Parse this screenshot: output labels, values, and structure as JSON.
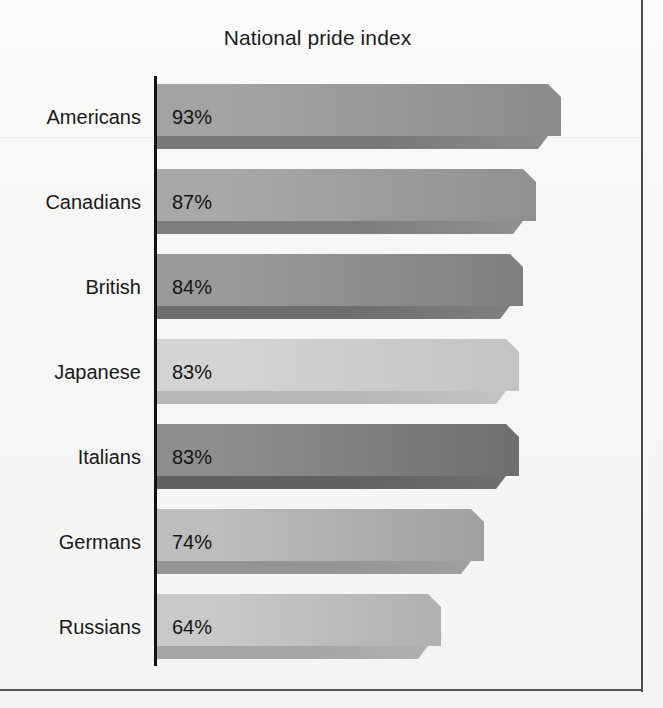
{
  "chart_data": {
    "type": "bar",
    "orientation": "horizontal",
    "title": "National pride index",
    "xlabel": "",
    "ylabel": "",
    "grid": false,
    "legend": false,
    "value_suffix": "%",
    "categories": [
      "Americans",
      "Canadians",
      "British",
      "Japanese",
      "Italians",
      "Germans",
      "Russians"
    ],
    "values": [
      93,
      87,
      84,
      83,
      83,
      74,
      64
    ],
    "value_labels": [
      "93%",
      "87%",
      "84%",
      "83%",
      "83%",
      "74%",
      "64%"
    ],
    "xlim": [
      0,
      100
    ],
    "bars": [
      {
        "category": "Americans",
        "value": 93,
        "label": "93%",
        "px_length": 404,
        "fill_light": "#a3a3a3",
        "fill_dark": "#8b8b8b",
        "edge": "#787878"
      },
      {
        "category": "Canadians",
        "value": 87,
        "label": "87%",
        "px_length": 379,
        "fill_light": "#a8a8a8",
        "fill_dark": "#909090",
        "edge": "#7d7d7d"
      },
      {
        "category": "British",
        "value": 84,
        "label": "84%",
        "px_length": 366,
        "fill_light": "#9a9a9a",
        "fill_dark": "#7f7f7f",
        "edge": "#6e6e6e"
      },
      {
        "category": "Japanese",
        "value": 83,
        "label": "83%",
        "px_length": 362,
        "fill_light": "#d4d4d4",
        "fill_dark": "#c3c3c3",
        "edge": "#b6b6b6"
      },
      {
        "category": "Italians",
        "value": 83,
        "label": "83%",
        "px_length": 362,
        "fill_light": "#8e8e8e",
        "fill_dark": "#6f6f6f",
        "edge": "#616161"
      },
      {
        "category": "Germans",
        "value": 74,
        "label": "74%",
        "px_length": 327,
        "fill_light": "#bdbdbd",
        "fill_dark": "#a0a0a0",
        "edge": "#949494"
      },
      {
        "category": "Russians",
        "value": 64,
        "label": "64%",
        "px_length": 284,
        "fill_light": "#c9c9c9",
        "fill_dark": "#b0b0b0",
        "edge": "#a5a5a5"
      }
    ]
  },
  "colors": {
    "page_background": "#f6f6f5",
    "frame_rule": "#4c4c4c",
    "axis": "#121212",
    "text": "#191919"
  }
}
